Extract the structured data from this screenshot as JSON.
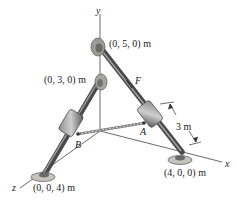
{
  "figure": {
    "axes": {
      "x": "x",
      "y": "y",
      "z": "z"
    },
    "points": {
      "top_y5": "(0, 5, 0) m",
      "mid_y3": "(0, 3, 0) m",
      "x4": "(4, 0, 0) m",
      "z4": "(0, 0, 4) m"
    },
    "labels": {
      "force": "F",
      "collar_A": "A",
      "collar_B": "B",
      "dimension": "3 m"
    },
    "colors": {
      "rod": "#5a5a5a",
      "rod_highlight": "#9a9a9a",
      "base": "#bdbdb5",
      "axis": "#444444"
    }
  }
}
